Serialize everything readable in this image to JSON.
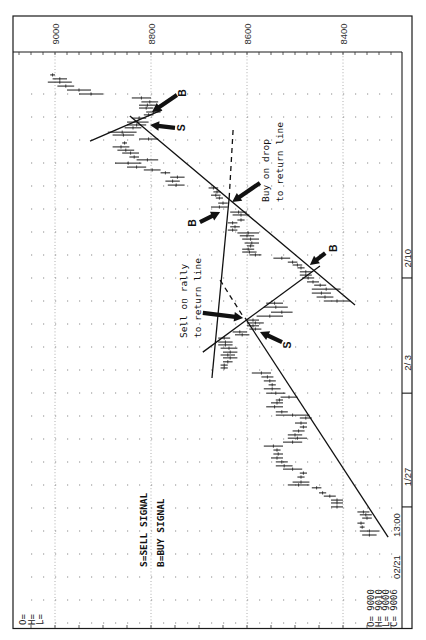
{
  "chart_data": {
    "type": "bar",
    "subtype": "ohlc",
    "orientation": "rotated 90 degrees (time runs bottom to top, price decreases left to right)",
    "title": "",
    "xlabel": "",
    "ylabel": "",
    "price_axis": {
      "ticks": [
        9000,
        8800,
        8600,
        8400
      ],
      "minor_step": 25,
      "range": [
        9087,
        8277
      ],
      "grid": true
    },
    "time_axis": {
      "start_label": "13:00",
      "ticks": [
        {
          "label": "1/27",
          "t": 7.8,
          "label_t": 16.1
        },
        {
          "label": "2/ 3",
          "t": 39.4,
          "label_t": 47.8
        },
        {
          "label": "2/10",
          "t": 71.4,
          "label_t": 76.9
        }
      ]
    },
    "bars_format": [
      "t",
      "high",
      "low"
    ],
    "bars": [
      [
        0,
        8360,
        8330
      ],
      [
        1.1,
        8365,
        8325
      ],
      [
        2.2,
        8365,
        8355
      ],
      [
        3.3,
        8370,
        8355
      ],
      [
        4.7,
        8360,
        8340
      ],
      [
        5.6,
        8365,
        8340
      ],
      [
        6.4,
        8370,
        8345
      ],
      [
        7.8,
        8425,
        8400
      ],
      [
        8.9,
        8425,
        8400
      ],
      [
        9.7,
        8425,
        8400
      ],
      [
        10.8,
        8440,
        8415
      ],
      [
        11.7,
        8450,
        8435
      ],
      [
        13.1,
        8465,
        8445
      ],
      [
        13.9,
        8515,
        8470
      ],
      [
        14.7,
        8505,
        8470
      ],
      [
        16.1,
        8495,
        8480
      ],
      [
        17.2,
        8490,
        8475
      ],
      [
        18.3,
        8525,
        8485
      ],
      [
        19.2,
        8540,
        8505
      ],
      [
        20.3,
        8540,
        8515
      ],
      [
        21.4,
        8550,
        8525
      ],
      [
        22.5,
        8545,
        8525
      ],
      [
        23.6,
        8545,
        8530
      ],
      [
        24.7,
        8565,
        8525
      ],
      [
        25.8,
        8525,
        8485
      ],
      [
        26.9,
        8515,
        8475
      ],
      [
        27.8,
        8515,
        8485
      ],
      [
        28.9,
        8505,
        8480
      ],
      [
        30.0,
        8490,
        8475
      ],
      [
        31.1,
        8500,
        8475
      ],
      [
        32.5,
        8490,
        8465
      ],
      [
        33.3,
        8540,
        8470
      ],
      [
        34.2,
        8540,
        8515
      ],
      [
        35.6,
        8560,
        8525
      ],
      [
        36.7,
        8550,
        8525
      ],
      [
        37.5,
        8540,
        8525
      ],
      [
        38.3,
        8530,
        8495
      ],
      [
        39.4,
        8560,
        8520
      ],
      [
        40.6,
        8565,
        8530
      ],
      [
        41.7,
        8555,
        8540
      ],
      [
        42.8,
        8565,
        8540
      ],
      [
        43.9,
        8570,
        8545
      ],
      [
        45.0,
        8590,
        8550
      ],
      [
        46.4,
        8655,
        8640
      ],
      [
        47.2,
        8655,
        8640
      ],
      [
        48.1,
        8650,
        8630
      ],
      [
        49.2,
        8650,
        8620
      ],
      [
        50.0,
        8655,
        8625
      ],
      [
        50.8,
        8650,
        8620
      ],
      [
        51.9,
        8655,
        8620
      ],
      [
        52.8,
        8660,
        8630
      ],
      [
        53.6,
        8660,
        8630
      ],
      [
        54.7,
        8660,
        8635
      ],
      [
        55.6,
        8625,
        8595
      ],
      [
        56.4,
        8630,
        8600
      ],
      [
        57.2,
        8595,
        8570
      ],
      [
        58.1,
        8600,
        8575
      ],
      [
        58.9,
        8600,
        8565
      ],
      [
        59.7,
        8600,
        8575
      ],
      [
        60.8,
        8580,
        8525
      ],
      [
        61.9,
        8550,
        8505
      ],
      [
        63.3,
        8565,
        8515
      ],
      [
        64.4,
        8560,
        8525
      ],
      [
        65.0,
        8440,
        8385
      ],
      [
        66.1,
        8455,
        8420
      ],
      [
        67.2,
        8465,
        8425
      ],
      [
        68.3,
        8465,
        8405
      ],
      [
        69.4,
        8460,
        8435
      ],
      [
        70.3,
        8475,
        8450
      ],
      [
        71.4,
        8485,
        8460
      ],
      [
        72.2,
        8490,
        8465
      ],
      [
        73.1,
        8490,
        8465
      ],
      [
        74.2,
        8495,
        8480
      ],
      [
        75.0,
        8505,
        8485
      ],
      [
        75.8,
        8515,
        8495
      ],
      [
        76.9,
        8545,
        8510
      ],
      [
        77.8,
        8595,
        8570
      ],
      [
        78.6,
        8610,
        8580
      ],
      [
        79.4,
        8610,
        8585
      ],
      [
        80.3,
        8600,
        8585
      ],
      [
        81.1,
        8605,
        8575
      ],
      [
        82.2,
        8610,
        8575
      ],
      [
        83.1,
        8615,
        8585
      ],
      [
        83.9,
        8620,
        8575
      ],
      [
        84.7,
        8640,
        8620
      ],
      [
        85.6,
        8635,
        8615
      ],
      [
        86.7,
        8640,
        8620
      ],
      [
        87.5,
        8620,
        8605
      ],
      [
        88.9,
        8630,
        8595
      ],
      [
        89.7,
        8635,
        8600
      ],
      [
        91.1,
        8675,
        8640
      ],
      [
        92.2,
        8660,
        8640
      ],
      [
        93.6,
        8665,
        8650
      ],
      [
        94.4,
        8675,
        8655
      ],
      [
        95.3,
        8670,
        8655
      ],
      [
        96.4,
        8680,
        8660
      ],
      [
        97.2,
        8765,
        8730
      ],
      [
        98.3,
        8770,
        8740
      ],
      [
        99.4,
        8760,
        8730
      ],
      [
        100.6,
        8780,
        8760
      ],
      [
        101.4,
        8815,
        8780
      ],
      [
        102.2,
        8850,
        8810
      ],
      [
        103.3,
        8875,
        8820
      ],
      [
        104.2,
        8830,
        8785
      ],
      [
        105.0,
        8845,
        8825
      ],
      [
        106.1,
        8860,
        8825
      ],
      [
        106.9,
        8870,
        8835
      ],
      [
        107.8,
        8880,
        8845
      ],
      [
        108.9,
        8860,
        8850
      ],
      [
        110.0,
        8825,
        8785
      ],
      [
        111.1,
        8880,
        8835
      ],
      [
        111.9,
        8890,
        8830
      ],
      [
        113.1,
        8855,
        8820
      ],
      [
        113.9,
        8850,
        8810
      ],
      [
        114.7,
        8850,
        8805
      ],
      [
        115.8,
        8840,
        8810
      ],
      [
        116.7,
        8815,
        8795
      ],
      [
        117.5,
        8810,
        8780
      ],
      [
        118.6,
        8825,
        8795
      ],
      [
        119.4,
        8825,
        8790
      ],
      [
        120.3,
        8820,
        8785
      ],
      [
        121.4,
        8840,
        8800
      ],
      [
        122.5,
        8950,
        8900
      ],
      [
        123.6,
        8975,
        8925
      ],
      [
        124.7,
        8995,
        8960
      ],
      [
        125.8,
        9015,
        8965
      ],
      [
        126.7,
        9005,
        8975
      ],
      [
        127.8,
        9010,
        9000
      ]
    ],
    "last_bar": {
      "date": "02/21",
      "open": 9000,
      "high": 9010,
      "low": 9000,
      "close": 9006
    },
    "lines": [
      {
        "name": "uptrend-line-upper",
        "from": [
          8844,
          116.4
        ],
        "to": [
          8375,
          63.9
        ],
        "style": "solid"
      },
      {
        "name": "short-line-top",
        "from": [
          8927,
          109.4
        ],
        "to": [
          8777,
          118.1
        ],
        "style": "solid"
      },
      {
        "name": "return-line",
        "from": [
          8637,
          93.9
        ],
        "to": [
          8673,
          43.6
        ],
        "style": "solid"
      },
      {
        "name": "return-line-extension-upper",
        "from": [
          8629,
          112.5
        ],
        "to": [
          8637,
          93.9
        ],
        "style": "dashed"
      },
      {
        "name": "return-line-extension-lower",
        "from": [
          8656,
          70.8
        ],
        "to": [
          8610,
          61.1
        ],
        "style": "dashed"
      },
      {
        "name": "channel-line-lower",
        "from": [
          8692,
          50.8
        ],
        "to": [
          8448,
          74.7
        ],
        "style": "solid"
      },
      {
        "name": "uptrend-line-lower",
        "from": [
          8604,
          60.3
        ],
        "to": [
          8306,
          -0.6
        ],
        "style": "solid"
      }
    ],
    "arrows": [
      {
        "name": "buy-signal-arrow-top",
        "label": "B",
        "head": [
          8798,
          117.5
        ],
        "tail": [
          8746,
          122.2
        ],
        "label_pos": [
          8735,
          122.8
        ]
      },
      {
        "name": "sell-signal-arrow-top",
        "label": "S",
        "head": [
          8802,
          113.9
        ],
        "tail": [
          8750,
          113.1
        ],
        "label_pos": [
          8737,
          113.1
        ]
      },
      {
        "name": "buy-on-drop-arrow",
        "label": "",
        "head": [
          8631,
          92.5
        ],
        "tail": [
          8573,
          97.8
        ]
      },
      {
        "name": "buy-signal-arrow-middle",
        "label": "B",
        "head": [
          8656,
          89.7
        ],
        "tail": [
          8698,
          86.9
        ],
        "label_pos": [
          8715,
          86.7
        ]
      },
      {
        "name": "buy-signal-arrow-lower",
        "label": "B",
        "head": [
          8469,
          75.0
        ],
        "tail": [
          8437,
          78.3
        ],
        "label_pos": [
          8421,
          79.7
        ]
      },
      {
        "name": "sell-on-rally-arrow",
        "label": "",
        "head": [
          8608,
          60.3
        ],
        "tail": [
          8692,
          61.7
        ]
      },
      {
        "name": "sell-signal-arrow-lower",
        "label": "S",
        "head": [
          8573,
          56.4
        ],
        "tail": [
          8527,
          53.6
        ],
        "label_pos": [
          8517,
          52.8
        ]
      }
    ],
    "annotations": [
      {
        "name": "sell-on-rally-note-line1",
        "text": "Sell on rally",
        "p": 8733,
        "t": 54.7
      },
      {
        "name": "sell-on-rally-note-line2",
        "text": "to return line",
        "p": 8704,
        "t": 54.7
      },
      {
        "name": "buy-on-drop-note-line1",
        "text": "Buy on drop",
        "p": 8562,
        "t": 92.5
      },
      {
        "name": "buy-on-drop-note-line2",
        "text": "to return line",
        "p": 8532,
        "t": 92.5
      }
    ],
    "legend": [
      {
        "text": "S=SELL SIGNAL",
        "p": 8815,
        "t": -8.9
      },
      {
        "text": "B=BUY SIGNAL",
        "p": 8781,
        "t": -8.9
      }
    ]
  },
  "readout": {
    "blank": [
      "O=",
      "H=",
      "L="
    ],
    "date": "02/21",
    "lines": [
      "O= 9000",
      "H= 9010",
      "L= 9000",
      "C= 9006"
    ]
  }
}
